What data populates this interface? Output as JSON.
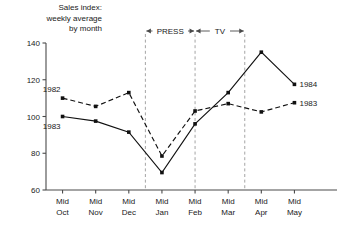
{
  "chart_data": {
    "type": "line",
    "title": "Sales index:\nweekly average\nby month",
    "xlabel": "",
    "ylabel": "",
    "ylim": [
      60,
      140
    ],
    "yticks": [
      60,
      80,
      100,
      120,
      140
    ],
    "ytick_labels": [
      "60",
      "80",
      "100",
      "120",
      "140"
    ],
    "grid": false,
    "legend": "inline-endpoint-labels",
    "categories": [
      "Mid Oct",
      "Mid Nov",
      "Mid Dec",
      "Mid Jan",
      "Mid Feb",
      "Mid Mar",
      "Mid Apr",
      "Mid May"
    ],
    "category_lines": [
      [
        "Mid",
        "Oct"
      ],
      [
        "Mid",
        "Nov"
      ],
      [
        "Mid",
        "Dec"
      ],
      [
        "Mid",
        "Jan"
      ],
      [
        "Mid",
        "Feb"
      ],
      [
        "Mid",
        "Mar"
      ],
      [
        "Mid",
        "Apr"
      ],
      [
        "Mid",
        "May"
      ]
    ],
    "series": [
      {
        "name": "1983",
        "style": "solid",
        "start_label": "1983",
        "end_label": "1984",
        "values": [
          100,
          97.5,
          91.5,
          69.5,
          96,
          113,
          135,
          117.5
        ]
      },
      {
        "name": "1982",
        "style": "dashed",
        "start_label": "1982",
        "end_label": "1983",
        "values": [
          110,
          105.5,
          113,
          78.5,
          103,
          107,
          102.5,
          107.5
        ]
      }
    ],
    "annotations": [
      {
        "label": "PRESS",
        "type": "span",
        "from_category": "Mid Dec",
        "to_category": "Mid Feb",
        "position": "top"
      },
      {
        "label": "TV",
        "type": "span",
        "from_category": "Mid Feb",
        "to_category": "Mid Mar",
        "position": "top"
      }
    ],
    "vertical_markers": [
      {
        "between": [
          "Mid Dec",
          "Mid Jan"
        ]
      },
      {
        "at": "Mid Feb"
      },
      {
        "between": [
          "Mid Mar",
          "Mid Apr"
        ]
      }
    ],
    "colors": {
      "line": "#111111",
      "axis": "#4a4a4a",
      "marker_rule": "#9a9a9a",
      "background": "#ffffff"
    }
  }
}
